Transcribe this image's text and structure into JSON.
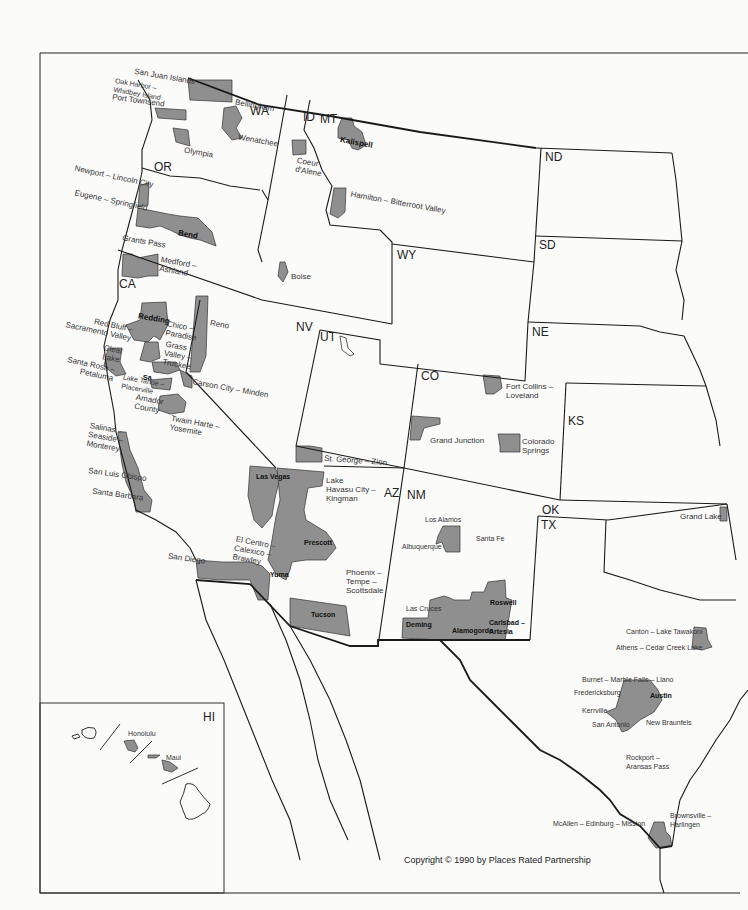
{
  "map": {
    "title": "Western United States — Places Rated retirement places",
    "copyright": "Copyright © 1990 by Places Rated Partnership",
    "colors": {
      "shaded": "#8f8f8f",
      "border": "#1a1a1a",
      "background": "#fbfbfa"
    },
    "states": [
      "WA",
      "ID",
      "MT",
      "OR",
      "ND",
      "SD",
      "WY",
      "CA",
      "NV",
      "UT",
      "NE",
      "CO",
      "KS",
      "AZ",
      "NM",
      "OK",
      "TX",
      "HI"
    ],
    "places": [
      {
        "name": "San Juan Islands",
        "state": "WA"
      },
      {
        "name": "Oak Harbor–Whidbey Island",
        "state": "WA"
      },
      {
        "name": "Port Townsend",
        "state": "WA"
      },
      {
        "name": "Bellingham",
        "state": "WA"
      },
      {
        "name": "Olympia",
        "state": "WA"
      },
      {
        "name": "Wenatchee",
        "state": "WA"
      },
      {
        "name": "Coeur d'Alene",
        "state": "ID"
      },
      {
        "name": "Boise",
        "state": "ID"
      },
      {
        "name": "Kalispell",
        "state": "MT"
      },
      {
        "name": "Hamilton–Bitterroot Valley",
        "state": "MT"
      },
      {
        "name": "Newport–Lincoln City",
        "state": "OR"
      },
      {
        "name": "Eugene–Springfield",
        "state": "OR"
      },
      {
        "name": "Bend",
        "state": "OR"
      },
      {
        "name": "Grants Pass",
        "state": "OR"
      },
      {
        "name": "Medford–Ashland",
        "state": "OR"
      },
      {
        "name": "Redding",
        "state": "CA"
      },
      {
        "name": "Red Bluff–Sacramento Valley",
        "state": "CA"
      },
      {
        "name": "Chico–Paradise",
        "state": "CA"
      },
      {
        "name": "Grass Valley–Truckee",
        "state": "CA"
      },
      {
        "name": "Clear Lake",
        "state": "CA"
      },
      {
        "name": "Santa Rosa–Petaluma",
        "state": "CA"
      },
      {
        "name": "Sacramento",
        "state": "CA"
      },
      {
        "name": "Lake Tahoe–Placerville",
        "state": "CA"
      },
      {
        "name": "Amador County",
        "state": "CA"
      },
      {
        "name": "Twain Harte–Yosemite",
        "state": "CA"
      },
      {
        "name": "Salinas–Seaside–Monterey",
        "state": "CA"
      },
      {
        "name": "San Luis Obispo",
        "state": "CA"
      },
      {
        "name": "Santa Barbara",
        "state": "CA"
      },
      {
        "name": "San Diego",
        "state": "CA"
      },
      {
        "name": "El Centro–Calexico–Brawley",
        "state": "CA"
      },
      {
        "name": "Reno",
        "state": "NV"
      },
      {
        "name": "Carson City–Minden",
        "state": "NV"
      },
      {
        "name": "Las Vegas",
        "state": "NV"
      },
      {
        "name": "St. George–Zion",
        "state": "UT"
      },
      {
        "name": "Fort Collins–Loveland",
        "state": "CO"
      },
      {
        "name": "Grand Junction",
        "state": "CO"
      },
      {
        "name": "Colorado Springs",
        "state": "CO"
      },
      {
        "name": "Lake Havasu City–Kingman",
        "state": "AZ"
      },
      {
        "name": "Prescott",
        "state": "AZ"
      },
      {
        "name": "Phoenix–Tempe–Scottsdale",
        "state": "AZ"
      },
      {
        "name": "Yuma",
        "state": "AZ"
      },
      {
        "name": "Tucson",
        "state": "AZ"
      },
      {
        "name": "Los Alamos",
        "state": "NM"
      },
      {
        "name": "Santa Fe",
        "state": "NM"
      },
      {
        "name": "Albuquerque",
        "state": "NM"
      },
      {
        "name": "Las Cruces",
        "state": "NM"
      },
      {
        "name": "Deming",
        "state": "NM"
      },
      {
        "name": "Alamogordo",
        "state": "NM"
      },
      {
        "name": "Roswell",
        "state": "NM"
      },
      {
        "name": "Carlsbad–Artesia",
        "state": "NM"
      },
      {
        "name": "Grand Lake",
        "state": "OK"
      },
      {
        "name": "Canton–Lake Tawakoni",
        "state": "TX"
      },
      {
        "name": "Athens–Cedar Creek Lake",
        "state": "TX"
      },
      {
        "name": "Burnet–Marble Falls–Llano",
        "state": "TX"
      },
      {
        "name": "Fredericksburg",
        "state": "TX"
      },
      {
        "name": "Austin",
        "state": "TX"
      },
      {
        "name": "Kerrville",
        "state": "TX"
      },
      {
        "name": "San Antonio",
        "state": "TX"
      },
      {
        "name": "New Braunfels",
        "state": "TX"
      },
      {
        "name": "Rockport–Aransas Pass",
        "state": "TX"
      },
      {
        "name": "McAllen–Edinburg–Mission",
        "state": "TX"
      },
      {
        "name": "Brownsville–Harlingen",
        "state": "TX"
      },
      {
        "name": "Honolulu",
        "state": "HI"
      },
      {
        "name": "Maui",
        "state": "HI"
      }
    ]
  },
  "labels": {
    "states": {
      "WA": "WA",
      "ID": "ID",
      "MT": "MT",
      "OR": "OR",
      "ND": "ND",
      "SD": "SD",
      "WY": "WY",
      "CA": "CA",
      "NV": "NV",
      "UT": "UT",
      "NE": "NE",
      "CO": "CO",
      "KS": "KS",
      "AZ": "AZ",
      "NM": "NM",
      "OK": "OK",
      "TX": "TX",
      "HI": "HI"
    },
    "sanjuan": "San Juan Islands",
    "oakharbor": "Oak Harbor –\nWhidbey Island",
    "porttownsend": "Port Townsend",
    "bellingham": "Bellingham",
    "olympia": "Olympia",
    "wenatchee": "Wenatchee",
    "coeur": "Coeur\nd'Alene",
    "boise": "Boise",
    "kalispell": "Kalispell",
    "hamilton": "Hamilton – Bitterroot Valley",
    "newport": "Newport – Lincoln City",
    "eugene": "Eugene – Springfield",
    "bend": "Bend",
    "grantspass": "Grants Pass",
    "medford": "Medford –\nAshland",
    "redding": "Redding",
    "redbluff": "Red Bluff –\nSacramento Valley",
    "chico": "Chico –\nParadise",
    "grassvalley": "Grass\nValley –\nTruckee",
    "clearlake": "Clear\nLake",
    "santarosa": "Santa Rosa –\nPetaluma",
    "sacramento": "Sa",
    "laketahoe": "Lake Tahoe –\nPlacerville",
    "amador": "Amador\nCounty",
    "twainharte": "Twain Harte –\nYosemite",
    "salinas": "Salinas –\nSeaside –\nMonterey",
    "sanluis": "San Luis Obispo",
    "santabarbara": "Santa Barbara",
    "sandiego": "San Diego",
    "elcentro": "El Centro –\nCalexico –\nBrawley",
    "reno": "Reno",
    "carson": "Carson City – Minden",
    "lasvegas": "Las Vegas",
    "stgeorge": "St. George – Zion",
    "fortcollins": "Fort Collins –\nLoveland",
    "grandjunction": "Grand Junction",
    "coloradosprings": "Colorado\nSprings",
    "havasu": "Lake\nHavasu City –\nKingman",
    "prescott": "Prescott",
    "phoenix": "Phoenix –\nTempe –\nScottsdale",
    "yuma": "Yuma",
    "tucson": "Tucson",
    "losalamos": "Los Alamos",
    "santafe": "Santa Fe",
    "albuquerque": "Albuquerque",
    "lascruces": "Las Cruces",
    "deming": "Deming",
    "alamogordo": "Alamogordo",
    "roswell": "Roswell",
    "carlsbad": "Carlsbad –\nArtesia",
    "grandlake": "Grand Lake",
    "canton": "Canton – Lake Tawakoni",
    "athens": "Athens – Cedar Creek Lake",
    "burnet": "Burnet – Marble Falls – Llano",
    "fredericksburg": "Fredericksburg",
    "austin": "Austin",
    "kerrville": "Kerrville",
    "sanantonio": "San Antonio",
    "newbraunfels": "New Braunfels",
    "rockport": "Rockport –\nAransas Pass",
    "mcallen": "McAllen – Edinburg – Mission",
    "brownsville": "Brownsville –\nHarlingen",
    "honolulu": "Honolulu",
    "maui": "Maui"
  }
}
